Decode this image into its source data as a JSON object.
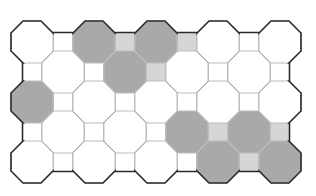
{
  "diagram": {
    "type": "octagon-square tiling",
    "colors": {
      "background": "#ffffff",
      "empty_fill": "#ffffff",
      "shaded_octagon": "#a9a9a9",
      "shaded_square": "#d6d6d6",
      "inner_stroke": "#bdbdbd",
      "outer_stroke": "#2b2b2b"
    },
    "geometry": {
      "col_period": 62,
      "row_period": 60,
      "octagon_half": 21,
      "octagon_chamfer": 12,
      "square_half": 9.5,
      "origin_x": 32,
      "origin_y": 42,
      "cols": 5,
      "rows": 3
    },
    "shaded_octagons_primary": [
      [
        1,
        0
      ],
      [
        2,
        0
      ],
      [
        0,
        1
      ],
      [
        3,
        2
      ],
      [
        4,
        2
      ]
    ],
    "shaded_octagons_offset": [
      [
        1,
        0
      ],
      [
        2,
        1
      ],
      [
        3,
        1
      ]
    ],
    "shaded_squares_primary": [
      [
        1,
        0
      ],
      [
        2,
        0
      ],
      [
        3,
        1
      ],
      [
        4,
        1
      ]
    ],
    "shaded_squares_offset": [
      [
        2,
        0
      ],
      [
        3,
        2
      ]
    ]
  }
}
